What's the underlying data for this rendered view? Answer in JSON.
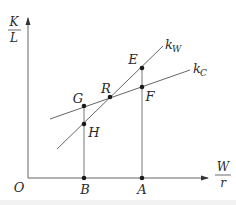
{
  "diagram": {
    "y_axis": {
      "numerator": "K",
      "denominator": "L"
    },
    "x_axis": {
      "numerator": "W",
      "denominator": "r"
    },
    "origin_label": "O",
    "lines": [
      {
        "name": "k_W",
        "label_main": "k",
        "label_sub": "W"
      },
      {
        "name": "k_C",
        "label_main": "k",
        "label_sub": "C"
      }
    ],
    "points": {
      "E": "E",
      "F": "F",
      "G": "G",
      "H": "H",
      "R": "R",
      "A": "A",
      "B": "B"
    },
    "colors": {
      "line": "#555555",
      "axis": "#666666",
      "point": "#1a1a1a"
    }
  }
}
